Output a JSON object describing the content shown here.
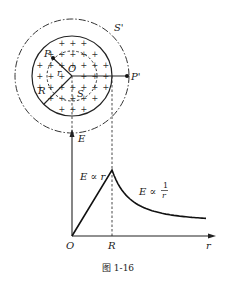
{
  "figure": {
    "caption": "图 1-16",
    "sphere": {
      "center_label": "O",
      "inner_point_label": "P",
      "outer_point_label": "P'",
      "radius_label": "R",
      "inner_radius_label": "r",
      "inner_surface_label": "S",
      "outer_surface_label": "S'",
      "charge_symbol": "+"
    },
    "graph": {
      "y_axis_label": "E",
      "x_axis_label": "r",
      "origin_label": "O",
      "R_tick_label": "R",
      "inside_relation": "E ∝ r",
      "outside_relation_prefix": "E ∝",
      "outside_relation_num": "1",
      "outside_relation_den": "r"
    }
  }
}
